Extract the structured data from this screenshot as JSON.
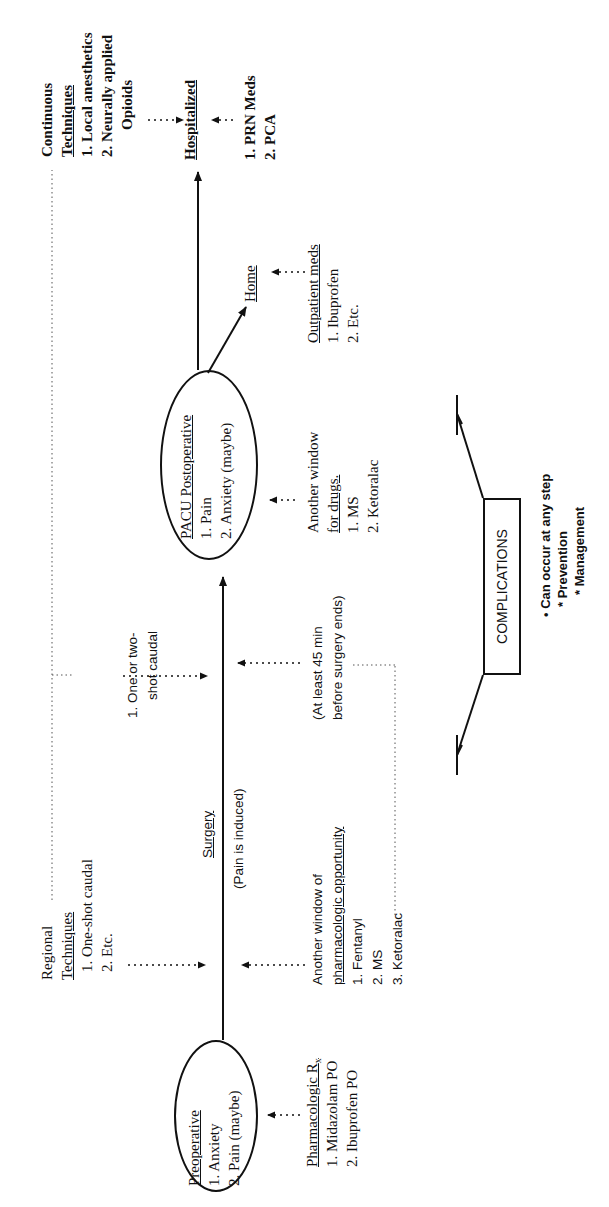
{
  "preoperative": {
    "title": "Preoperative",
    "items": [
      "1. Anxiety",
      "2. Pain (maybe)"
    ]
  },
  "pharmacologic_rx": {
    "title": "Pharmacologic R",
    "title_sub": "x",
    "items": [
      "1. Midazolam PO",
      "2. Ibuprofen PO"
    ]
  },
  "regional_techniques": {
    "title_line1": "Regional",
    "title_line2": "Techniques",
    "items": [
      "1. One-shot caudal",
      "2. Etc."
    ]
  },
  "surgery": {
    "title": "Surgery",
    "subtitle": "(Pain is induced)"
  },
  "intraop_window": {
    "line1": "Another window of",
    "line2": "pharmacologic opportunity",
    "items": [
      "1. Fentanyl",
      "2. MS",
      "3. Ketoralac"
    ]
  },
  "caudal_option": {
    "line1": "1. One or two-",
    "line2": "shot caudal"
  },
  "timing_note": {
    "line1": "(At least 45 min",
    "line2": "before surgery ends)"
  },
  "pacu": {
    "title": "PACU Postoperative",
    "items": [
      "1. Pain",
      "2. Anxiety (maybe)"
    ]
  },
  "pacu_window": {
    "line1": "Another window",
    "line2": "for drugs.",
    "items": [
      "1. MS",
      "2. Ketoralac"
    ]
  },
  "home": {
    "title": "Home"
  },
  "outpatient_meds": {
    "title": "Outpatient meds",
    "items": [
      "1. Ibuprofen",
      "2. Etc."
    ]
  },
  "hospitalized": {
    "title": "Hospitalized"
  },
  "continuous_techniques": {
    "title_line1": "Continuous",
    "title_line2": "Techniques",
    "items": [
      "1. Local anesthetics",
      "2. Neurally applied",
      "Opioids"
    ]
  },
  "hospital_meds": {
    "items": [
      "1. PRN Meds",
      "2. PCA"
    ]
  },
  "complications": {
    "title": "COMPLICATIONS",
    "note": "• Can occur at any step",
    "sub_items": [
      "* Prevention",
      "* Management"
    ]
  },
  "colors": {
    "ink": "#111111",
    "background": "#ffffff"
  }
}
